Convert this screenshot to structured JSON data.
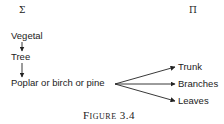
{
  "diagram": {
    "left_symbol": "Σ",
    "right_symbol": "Π",
    "hierarchy": [
      {
        "label": "Vegetal"
      },
      {
        "label": "Tree"
      },
      {
        "label": "Poplar or birch or pine"
      }
    ],
    "parts": [
      {
        "label": "Trunk"
      },
      {
        "label": "Branches"
      },
      {
        "label": "Leaves"
      }
    ],
    "caption": "Figure 3.4"
  }
}
